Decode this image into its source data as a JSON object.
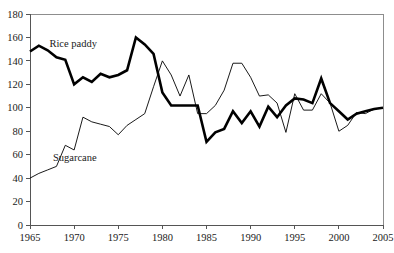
{
  "chart_data": {
    "type": "line",
    "title": "",
    "subtitle": "",
    "xlabel": "",
    "ylabel": "",
    "xlim": [
      1965,
      2005
    ],
    "ylim": [
      0,
      180
    ],
    "grid": false,
    "legend_position": "inline-annotation",
    "x_ticks": [
      "1965",
      "1970",
      "1975",
      "1980",
      "1985",
      "1990",
      "1995",
      "2000",
      "2005"
    ],
    "x_tick_values": [
      1965,
      1970,
      1975,
      1980,
      1985,
      1990,
      1995,
      2000,
      2005
    ],
    "y_ticks": [
      "0",
      "20",
      "40",
      "60",
      "80",
      "100",
      "120",
      "140",
      "160",
      "180"
    ],
    "y_tick_values": [
      0,
      20,
      40,
      60,
      80,
      100,
      120,
      140,
      160,
      180
    ],
    "x": [
      1965,
      1966,
      1967,
      1968,
      1969,
      1970,
      1971,
      1972,
      1973,
      1974,
      1975,
      1976,
      1977,
      1978,
      1979,
      1980,
      1981,
      1982,
      1983,
      1984,
      1985,
      1986,
      1987,
      1988,
      1989,
      1990,
      1991,
      1992,
      1993,
      1994,
      1995,
      1996,
      1997,
      1998,
      1999,
      2000,
      2001,
      2002,
      2003,
      2004,
      2005
    ],
    "series": [
      {
        "name": "Rice paddy",
        "style": "thick",
        "color": "#000000",
        "label_x": 1967.2,
        "label_y": 152,
        "values": [
          148,
          153,
          149,
          143,
          141,
          120,
          126,
          122,
          129,
          126,
          128,
          132,
          160,
          154,
          146,
          113,
          102,
          102,
          102,
          102,
          71,
          79,
          82,
          97,
          87,
          97,
          84,
          101,
          92,
          102,
          108,
          107,
          104,
          125,
          104,
          97,
          90,
          95,
          97,
          99,
          100
        ]
      },
      {
        "name": "Sugarcane",
        "style": "thin",
        "color": "#000000",
        "label_x": 1967.6,
        "label_y": 55,
        "values": [
          40,
          44,
          47,
          50,
          68,
          64,
          92,
          88,
          86,
          84,
          77,
          85,
          90,
          95,
          118,
          140,
          128,
          110,
          128,
          95,
          95,
          102,
          115,
          138,
          138,
          126,
          110,
          111,
          104,
          79,
          112,
          98,
          98,
          112,
          104,
          80,
          85,
          96,
          95,
          99,
          100
        ]
      }
    ]
  },
  "axes": {
    "plot_left_px": 30,
    "plot_right_px": 383,
    "plot_top_px": 14,
    "plot_bottom_px": 225
  }
}
